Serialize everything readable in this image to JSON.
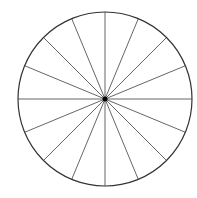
{
  "diagram": {
    "type": "circle-divided-into-sectors",
    "sectors": 16,
    "diameters": 8,
    "angle_step_degrees": 22.5,
    "center": [
      105,
      99
    ],
    "radius": 87,
    "colors": {
      "background": "#ffffff",
      "outline": "#333333",
      "spokes": "#555555",
      "center_dot": "#000000"
    }
  }
}
